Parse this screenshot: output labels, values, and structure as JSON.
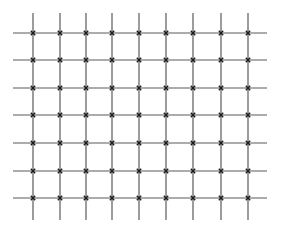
{
  "diagram": {
    "type": "lattice-grid",
    "rows": 7,
    "columns": 9,
    "column_x": [
      33,
      60,
      86,
      112,
      139,
      166,
      193,
      221,
      248
    ],
    "row_y": [
      33,
      60,
      88,
      115,
      143,
      171,
      198
    ],
    "horizontal_extent": [
      13,
      267
    ],
    "vertical_extent": [
      13,
      220
    ],
    "intersection_marker": "x-cross",
    "colors": {
      "line": "#5a5a5a",
      "marker": "#1a1a1a",
      "background": "#ffffff"
    }
  }
}
